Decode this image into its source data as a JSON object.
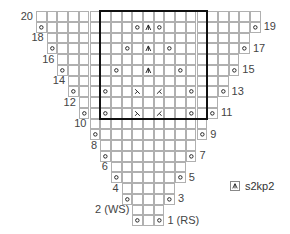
{
  "chart": {
    "columns": 21,
    "rows": 20,
    "repeat_box": {
      "col_start": 6,
      "col_end": 15,
      "row_top": 20,
      "row_bottom": 11
    },
    "row_shapes": [
      {
        "row": 20,
        "start": 0,
        "end": 20
      },
      {
        "row": 19,
        "start": 0,
        "end": 20
      },
      {
        "row": 18,
        "start": 1,
        "end": 19
      },
      {
        "row": 17,
        "start": 1,
        "end": 19
      },
      {
        "row": 16,
        "start": 2,
        "end": 18
      },
      {
        "row": 15,
        "start": 2,
        "end": 18
      },
      {
        "row": 14,
        "start": 3,
        "end": 17
      },
      {
        "row": 13,
        "start": 3,
        "end": 17
      },
      {
        "row": 12,
        "start": 4,
        "end": 16
      },
      {
        "row": 11,
        "start": 4,
        "end": 16
      },
      {
        "row": 10,
        "start": 5,
        "end": 15
      },
      {
        "row": 9,
        "start": 5,
        "end": 15
      },
      {
        "row": 8,
        "start": 6,
        "end": 14
      },
      {
        "row": 7,
        "start": 6,
        "end": 14
      },
      {
        "row": 6,
        "start": 7,
        "end": 13
      },
      {
        "row": 5,
        "start": 7,
        "end": 13
      },
      {
        "row": 4,
        "start": 8,
        "end": 12
      },
      {
        "row": 3,
        "start": 8,
        "end": 12
      },
      {
        "row": 2,
        "start": 9,
        "end": 11
      },
      {
        "row": 1,
        "start": 9,
        "end": 11
      }
    ],
    "stitches": [
      {
        "row": 19,
        "col": 0,
        "type": "yo"
      },
      {
        "row": 19,
        "col": 9,
        "type": "yo"
      },
      {
        "row": 19,
        "col": 10,
        "type": "s2kp2"
      },
      {
        "row": 19,
        "col": 11,
        "type": "yo"
      },
      {
        "row": 19,
        "col": 20,
        "type": "yo"
      },
      {
        "row": 17,
        "col": 1,
        "type": "yo"
      },
      {
        "row": 17,
        "col": 8,
        "type": "yo"
      },
      {
        "row": 17,
        "col": 10,
        "type": "s2kp2"
      },
      {
        "row": 17,
        "col": 12,
        "type": "yo"
      },
      {
        "row": 17,
        "col": 19,
        "type": "yo"
      },
      {
        "row": 15,
        "col": 2,
        "type": "yo"
      },
      {
        "row": 15,
        "col": 7,
        "type": "yo"
      },
      {
        "row": 15,
        "col": 10,
        "type": "s2kp2"
      },
      {
        "row": 15,
        "col": 13,
        "type": "yo"
      },
      {
        "row": 15,
        "col": 18,
        "type": "yo"
      },
      {
        "row": 13,
        "col": 3,
        "type": "yo"
      },
      {
        "row": 13,
        "col": 6,
        "type": "yo"
      },
      {
        "row": 13,
        "col": 9,
        "type": "ssk"
      },
      {
        "row": 13,
        "col": 11,
        "type": "k2tog"
      },
      {
        "row": 13,
        "col": 14,
        "type": "yo"
      },
      {
        "row": 13,
        "col": 17,
        "type": "yo"
      },
      {
        "row": 11,
        "col": 4,
        "type": "yo"
      },
      {
        "row": 11,
        "col": 6,
        "type": "yo"
      },
      {
        "row": 11,
        "col": 9,
        "type": "ssk"
      },
      {
        "row": 11,
        "col": 11,
        "type": "k2tog"
      },
      {
        "row": 11,
        "col": 14,
        "type": "yo"
      },
      {
        "row": 11,
        "col": 16,
        "type": "yo"
      },
      {
        "row": 9,
        "col": 5,
        "type": "yo"
      },
      {
        "row": 9,
        "col": 15,
        "type": "yo"
      },
      {
        "row": 7,
        "col": 6,
        "type": "yo"
      },
      {
        "row": 7,
        "col": 14,
        "type": "yo"
      },
      {
        "row": 5,
        "col": 7,
        "type": "yo"
      },
      {
        "row": 5,
        "col": 13,
        "type": "yo"
      },
      {
        "row": 3,
        "col": 8,
        "type": "yo"
      },
      {
        "row": 3,
        "col": 12,
        "type": "yo"
      },
      {
        "row": 1,
        "col": 9,
        "type": "yo"
      },
      {
        "row": 1,
        "col": 11,
        "type": "yo"
      }
    ],
    "row_labels": [
      {
        "row": 20,
        "text": "20",
        "side": "left"
      },
      {
        "row": 19,
        "text": "19",
        "side": "right"
      },
      {
        "row": 18,
        "text": "18",
        "side": "left"
      },
      {
        "row": 17,
        "text": "17",
        "side": "right"
      },
      {
        "row": 16,
        "text": "16",
        "side": "left"
      },
      {
        "row": 15,
        "text": "15",
        "side": "right"
      },
      {
        "row": 14,
        "text": "14",
        "side": "left"
      },
      {
        "row": 13,
        "text": "13",
        "side": "right"
      },
      {
        "row": 12,
        "text": "12",
        "side": "left"
      },
      {
        "row": 11,
        "text": "11",
        "side": "right"
      },
      {
        "row": 10,
        "text": "10",
        "side": "left"
      },
      {
        "row": 9,
        "text": "9",
        "side": "right"
      },
      {
        "row": 8,
        "text": "8",
        "side": "left"
      },
      {
        "row": 7,
        "text": "7",
        "side": "right"
      },
      {
        "row": 6,
        "text": "6",
        "side": "left"
      },
      {
        "row": 5,
        "text": "5",
        "side": "right"
      },
      {
        "row": 4,
        "text": "4",
        "side": "left"
      },
      {
        "row": 3,
        "text": "3",
        "side": "right"
      },
      {
        "row": 2,
        "text": "2 (WS)",
        "side": "left"
      },
      {
        "row": 1,
        "text": "1 (RS)",
        "side": "right"
      }
    ]
  },
  "legend": {
    "items": [
      {
        "symbol": "s2kp2-icon",
        "label": "s2kp2"
      }
    ]
  },
  "colors": {
    "grid_line": "#b0b0b0",
    "repeat_box": "#111111",
    "symbol": "#222222",
    "text": "#444444"
  }
}
